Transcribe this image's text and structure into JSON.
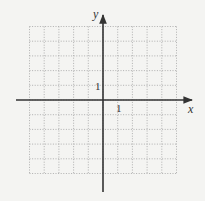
{
  "diagram": {
    "type": "coordinate-grid",
    "x_axis_label": "x",
    "y_axis_label": "y",
    "x_tick_label": "1",
    "y_tick_label": "1",
    "grid": {
      "x_min": -5,
      "x_max": 5,
      "y_min": -5,
      "y_max": 5,
      "step": 1,
      "style": "dotted"
    },
    "colors": {
      "background": "#f4f4f2",
      "grid": "#a8a8a8",
      "axis": "#333333",
      "text": "#333333"
    }
  }
}
